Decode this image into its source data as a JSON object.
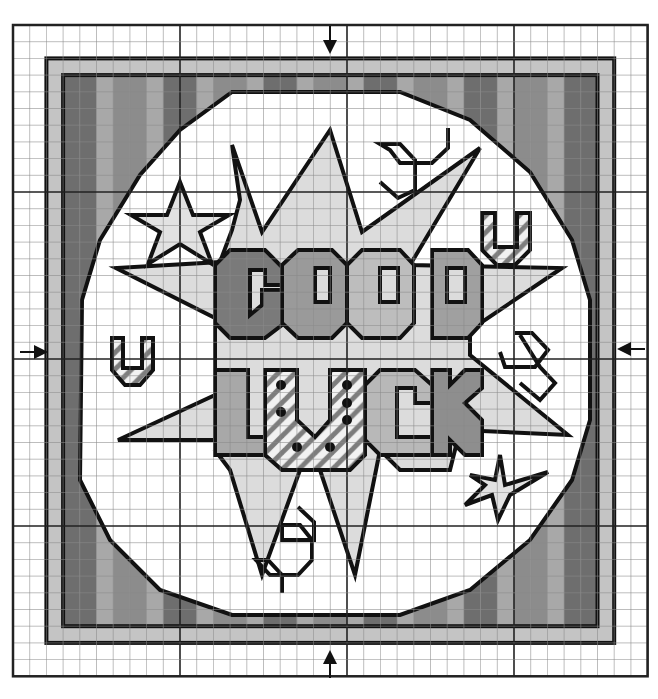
{
  "chart_title": "Good Luck cross-stitch chart",
  "grid": {
    "x0": 13,
    "y0": 25,
    "cell": 16.7,
    "cols": 38,
    "rows": 39,
    "center_col": 19,
    "center_row": 20,
    "major_every": 10
  },
  "colors": {
    "bg": "#ffffff",
    "grid_minor": "#8a8a8a",
    "grid_major": "#222222",
    "outline": "#111111",
    "border_light": "#c4c4c4",
    "stripe_dark": "#6e6e6e",
    "stripe_mid": "#8c8c8c",
    "stripe_light": "#a8a8a8",
    "burst_fill": "#dcdcdc",
    "letter_g": "#7a7a7a",
    "letter_o1": "#9a9a9a",
    "letter_o2": "#bdbdbd",
    "letter_d": "#a0a0a0",
    "letter_l": "#a8a8a8",
    "letter_c": "#b8b8b8",
    "letter_k": "#8e8e8e",
    "hatch": "#9c9c9c",
    "star_fill": "#e2e2e2"
  },
  "center_arrows": [
    {
      "name": "top-center-arrow",
      "dir": "down",
      "x": 330,
      "y": 44
    },
    {
      "name": "bottom-center-arrow",
      "dir": "up",
      "x": 330,
      "y": 660
    },
    {
      "name": "left-center-arrow",
      "dir": "right",
      "x": 38,
      "y": 352
    },
    {
      "name": "right-center-arrow",
      "dir": "left",
      "x": 627,
      "y": 349
    }
  ],
  "words": [
    "GOOD",
    "LUCK"
  ]
}
